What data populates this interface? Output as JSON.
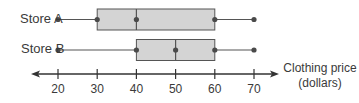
{
  "chart_data": {
    "type": "boxplot",
    "title": "",
    "xlabel": "Clothing price (dollars)",
    "xlabel_lines": [
      "Clothing price",
      "(dollars)"
    ],
    "ylabel": "",
    "xlim": [
      20,
      70
    ],
    "x_ticks": [
      20,
      30,
      40,
      50,
      60,
      70
    ],
    "x_tick_labels": [
      "20",
      "30",
      "40",
      "50",
      "60",
      "70"
    ],
    "grid": false,
    "legend": null,
    "series": [
      {
        "name": "Store A",
        "min": 20,
        "q1": 30,
        "median": 40,
        "q3": 60,
        "max": 70
      },
      {
        "name": "Store B",
        "min": 20,
        "q1": 40,
        "median": 50,
        "q3": 60,
        "max": 70
      }
    ],
    "colors": {
      "box_fill": "#d4d4d4",
      "box_stroke": "#555555",
      "line": "#555555",
      "dot": "#4a4a4a",
      "axis": "#333333"
    }
  }
}
